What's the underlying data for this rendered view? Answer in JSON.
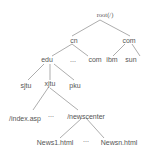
{
  "diagram": {
    "type": "tree",
    "title": "",
    "nodes": {
      "root": "root(/)",
      "cn": "cn",
      "com_top": "com",
      "edu": "edu",
      "ellipsis_1": "...",
      "com_cn": "com",
      "ibm": "ibm",
      "sun": "sun",
      "sjtu": "sjtu",
      "xjtu": "xjtu",
      "pku": "pku",
      "index": "/index.asp",
      "ellipsis_2": "...",
      "newscenter": "/newscenter",
      "news1": "News1.html",
      "ellipsis_3": "...",
      "newsn": "Newsn.html"
    },
    "edges": [
      [
        "root",
        "cn"
      ],
      [
        "root",
        "com_top"
      ],
      [
        "cn",
        "edu"
      ],
      [
        "cn",
        "com_cn"
      ],
      [
        "com_top",
        "ibm"
      ],
      [
        "com_top",
        "sun"
      ],
      [
        "edu",
        "sjtu"
      ],
      [
        "edu",
        "xjtu"
      ],
      [
        "edu",
        "pku"
      ],
      [
        "xjtu",
        "index"
      ],
      [
        "xjtu",
        "newscenter"
      ],
      [
        "newscenter",
        "news1"
      ],
      [
        "newscenter",
        "newsn"
      ]
    ],
    "colors": {
      "line": "#888888",
      "text": "#555555"
    }
  }
}
